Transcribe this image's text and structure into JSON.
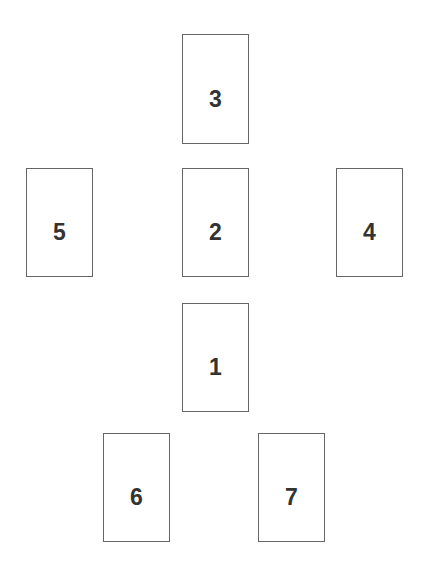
{
  "board": {
    "name": "numbered-card-layout",
    "width": 422,
    "height": 576,
    "background_color": "#ffffff",
    "card_border_color": "#666666",
    "card_fill_color": "#ffffff",
    "label_color": "#333333",
    "card_width": 67,
    "card_height": 109
  },
  "cards": [
    {
      "label": "3",
      "x": 182,
      "y": 34,
      "width": 67,
      "height": 110,
      "row": 1,
      "position": "top-center"
    },
    {
      "label": "5",
      "x": 26,
      "y": 168,
      "width": 67,
      "height": 109,
      "row": 2,
      "position": "middle-left"
    },
    {
      "label": "2",
      "x": 182,
      "y": 168,
      "width": 67,
      "height": 109,
      "row": 2,
      "position": "middle-center"
    },
    {
      "label": "4",
      "x": 336,
      "y": 168,
      "width": 67,
      "height": 109,
      "row": 2,
      "position": "middle-right"
    },
    {
      "label": "1",
      "x": 182,
      "y": 303,
      "width": 67,
      "height": 109,
      "row": 3,
      "position": "center-below"
    },
    {
      "label": "6",
      "x": 103,
      "y": 433,
      "width": 67,
      "height": 109,
      "row": 4,
      "position": "bottom-left"
    },
    {
      "label": "7",
      "x": 258,
      "y": 433,
      "width": 67,
      "height": 109,
      "row": 4,
      "position": "bottom-right"
    }
  ]
}
